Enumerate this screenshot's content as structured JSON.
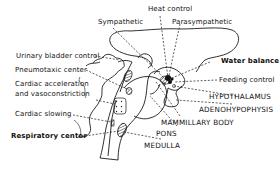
{
  "diagram": {
    "stroke_color": "#1a1a1a",
    "background": "#ffffff",
    "labels": {
      "heat_control": "Heat control",
      "sympathetic": "Sympathetic",
      "parasympathetic": "Parasympathetic",
      "urinary_bladder_control": "Urinary bladder control",
      "pneumotaxic_center": "Pneumotaxic center",
      "cardiac_acceleration_line1": "Cardiac acceleration",
      "cardiac_acceleration_line2": "and vasoconstriction",
      "cardiac_slowing": "Cardiac slowing",
      "respiratory_center": "Respiratory center",
      "water_balance": "Water balance",
      "feeding_control": "Feeding control",
      "hypothalamus": "HYPOTHALAMUS",
      "adenohypophysis": "ADENOHYPOPHYSIS",
      "mammillary_body": "MAMMILLARY BODY",
      "pons": "PONS",
      "medulla": "MEDULLA"
    }
  }
}
